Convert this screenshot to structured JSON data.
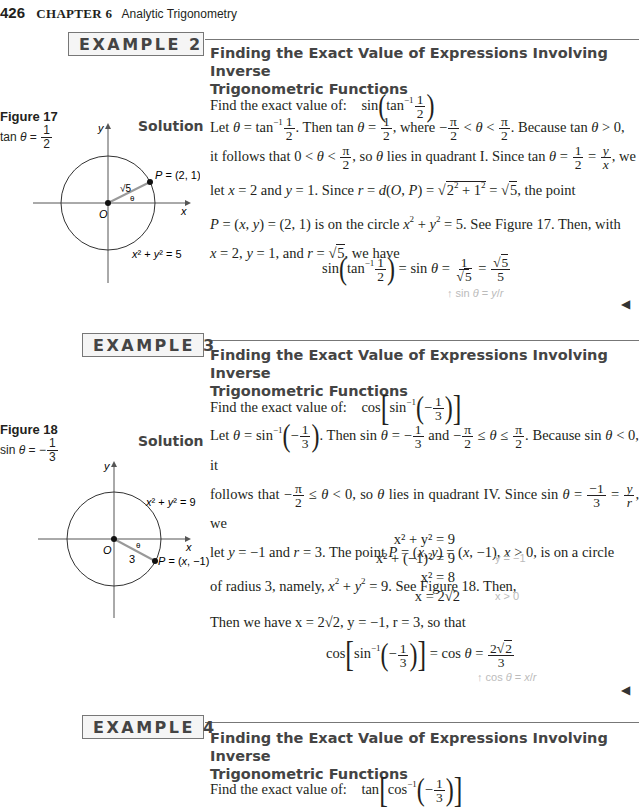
{
  "running_head": {
    "page_number": "426",
    "chapter": "CHAPTER 6",
    "chapter_title": "Analytic Trigonometry"
  },
  "examples": [
    {
      "label": "EXAMPLE 2",
      "title_line1": "Finding the Exact Value of Expressions Involving Inverse",
      "title_line2": "Trigonometric Functions",
      "prompt": "Find the exact value of:",
      "expression": "sin(tan⁻¹ 1/2)",
      "solution_label": "Solution",
      "figure": {
        "label": "Figure 17",
        "caption": "tan θ = 1/2",
        "circle_equation": "x² + y² = 5",
        "point_label": "P = (2, 1)",
        "radius_label": "√5",
        "origin_label": "O",
        "x_axis_label": "x",
        "y_axis_label": "y",
        "angle_label": "θ"
      },
      "solution_text": [
        "Let θ = tan⁻¹ 1/2. Then tan θ = 1/2, where −π/2 < θ < π/2. Because tan θ > 0,",
        "it follows that 0 < θ < π/2, so θ lies in quadrant I. Since tan θ = 1/2 = y/x, we",
        "let x = 2 and y = 1. Since r = d(O, P) = √(2² + 1²) = √5, the point",
        "P = (x, y) = (2, 1) is on the circle x² + y² = 5. See Figure 17. Then, with",
        "x = 2, y = 1, and r = √5, we have"
      ],
      "result": "sin(tan⁻¹ 1/2) = sin θ = 1/√5 = √5/5",
      "annotation": "sin θ = y/r"
    },
    {
      "label": "EXAMPLE 3",
      "title_line1": "Finding the Exact Value of Expressions Involving Inverse",
      "title_line2": "Trigonometric Functions",
      "prompt": "Find the exact value of:",
      "expression": "cos[sin⁻¹(−1/3)]",
      "solution_label": "Solution",
      "figure": {
        "label": "Figure 18",
        "caption": "sin θ = −1/3",
        "circle_equation": "x² + y² = 9",
        "point_label": "P = (x, −1)",
        "radius_label": "3",
        "origin_label": "O",
        "x_axis_label": "x",
        "y_axis_label": "y",
        "angle_label": "θ"
      },
      "solution_text": [
        "Let θ = sin⁻¹(−1/3). Then sin θ = −1/3 and −π/2 ≤ θ ≤ π/2. Because sin θ < 0, it",
        "follows that −π/2 ≤ θ < 0, so θ lies in quadrant IV. Since sin θ = −1/3 = y/r, we",
        "let y = −1 and r = 3. The point P = (x, y) = (x, −1), x > 0, is on a circle",
        "of radius 3, namely, x² + y² = 9. See Figure 18. Then,"
      ],
      "derivation": [
        {
          "eq": "x² + y² = 9",
          "note": ""
        },
        {
          "eq": "x² + (−1)² = 9",
          "note": "y = −1"
        },
        {
          "eq": "x² = 8",
          "note": ""
        },
        {
          "eq": "x = 2√2",
          "note": "x > 0"
        }
      ],
      "then_text": "Then we have x = 2√2, y = −1, r = 3, so that",
      "result": "cos[sin⁻¹(−1/3)] = cos θ = 2√2/3",
      "annotation": "cos θ = x/r"
    },
    {
      "label": "EXAMPLE 4",
      "title_line1": "Finding the Exact Value of Expressions Involving Inverse",
      "title_line2": "Trigonometric Functions",
      "prompt": "Find the exact value of:",
      "expression": "tan[cos⁻¹(−1/3)]"
    }
  ],
  "end_marker": "◀"
}
